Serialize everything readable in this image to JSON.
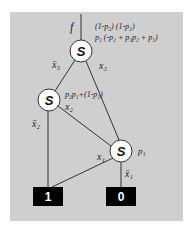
{
  "diagram": {
    "background_color": "#cfcfcf",
    "root_label": "f",
    "root_annotation": {
      "line1": "(1-p₃) (1-p₂)",
      "line2": "p₁ (-p₂ + p₃p₂ + p₃)"
    },
    "nodes": [
      {
        "id": "n1",
        "label": "S",
        "annotation_neg": "x̄₃",
        "annotation_pos": "x₃"
      },
      {
        "id": "n2",
        "label": "S",
        "annotation": "p₂p₁+(1-p₂)",
        "annotation_neg": "x̄₂",
        "annotation_pos": "x₂"
      },
      {
        "id": "n3",
        "label": "S",
        "annotation": "p₁",
        "annotation_neg": "x̄₁",
        "annotation_pos": "x₁"
      }
    ],
    "terminals": [
      {
        "id": "t1",
        "label": "1"
      },
      {
        "id": "t0",
        "label": "0"
      }
    ],
    "edges": [
      {
        "from": "f",
        "to": "n1"
      },
      {
        "from": "n1",
        "to": "n2",
        "label": "x̄₃"
      },
      {
        "from": "n1",
        "to": "n3",
        "label": "x₃"
      },
      {
        "from": "n2",
        "to": "t1",
        "label": "x̄₂"
      },
      {
        "from": "n2",
        "to": "n3",
        "label": "x₂"
      },
      {
        "from": "n3",
        "to": "t1",
        "label": "x₁"
      },
      {
        "from": "n3",
        "to": "t0",
        "label": "x̄₁"
      }
    ]
  }
}
